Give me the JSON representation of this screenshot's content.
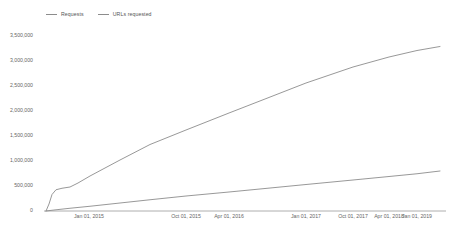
{
  "chart_data": {
    "type": "line",
    "title": "",
    "xlabel": "",
    "ylabel": "",
    "grid": false,
    "legend_position": "top-left",
    "ylim": [
      0,
      3500000
    ],
    "ytick_labels": [
      "3,500,000",
      "3,000,000",
      "2,500,000",
      "2,000,000",
      "1,500,000",
      "1,000,000",
      "500,000",
      "0"
    ],
    "ytick_values": [
      3500000,
      3000000,
      2500000,
      2000000,
      1500000,
      1000000,
      500000,
      0
    ],
    "xtick_labels": [
      "Jan 01, 2015",
      "Oct 01, 2015",
      "Apr 01, 2016",
      "Jan 01, 2017",
      "Oct 01, 2017",
      "Apr 01, 2018",
      "Jan 01, 2019"
    ],
    "xtick_positions": [
      89,
      186,
      229,
      306,
      353,
      389,
      417
    ],
    "series": [
      {
        "name": "Requests",
        "color": "#8c8c8c",
        "points": [
          [
            46,
            0
          ],
          [
            55,
            22000
          ],
          [
            70,
            55000
          ],
          [
            90,
            95000
          ],
          [
            120,
            160000
          ],
          [
            150,
            225000
          ],
          [
            186,
            300000
          ],
          [
            229,
            380000
          ],
          [
            265,
            450000
          ],
          [
            306,
            530000
          ],
          [
            353,
            620000
          ],
          [
            389,
            690000
          ],
          [
            417,
            745000
          ],
          [
            440,
            800000
          ]
        ]
      },
      {
        "name": "URLs requested",
        "color": "#8c8c8c",
        "points": [
          [
            46,
            0
          ],
          [
            49,
            140000
          ],
          [
            52,
            330000
          ],
          [
            56,
            425000
          ],
          [
            62,
            455000
          ],
          [
            70,
            480000
          ],
          [
            78,
            560000
          ],
          [
            90,
            700000
          ],
          [
            120,
            1020000
          ],
          [
            150,
            1330000
          ],
          [
            186,
            1620000
          ],
          [
            229,
            1960000
          ],
          [
            265,
            2240000
          ],
          [
            306,
            2560000
          ],
          [
            353,
            2880000
          ],
          [
            389,
            3080000
          ],
          [
            417,
            3210000
          ],
          [
            440,
            3290000
          ]
        ]
      }
    ]
  },
  "legend": {
    "items": [
      {
        "label": "Requests"
      },
      {
        "label": "URLs requested"
      }
    ]
  }
}
